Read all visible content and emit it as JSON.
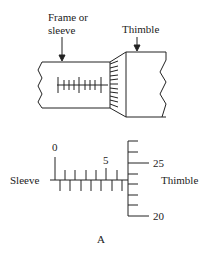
{
  "top_diagram": {
    "frame_label_line1": "Frame or",
    "frame_label_line2": "sleeve",
    "thimble_label": "Thimble"
  },
  "scale_diagram": {
    "sleeve_label": "Sleeve",
    "thimble_label": "Thimble",
    "sleeve_marks": [
      "0",
      "5"
    ],
    "thimble_marks": [
      "25",
      "20"
    ]
  },
  "caption": "A",
  "colors": {
    "line": "#222222",
    "background": "#ffffff"
  }
}
